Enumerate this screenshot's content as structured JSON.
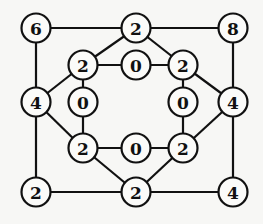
{
  "diagram": {
    "type": "graph",
    "nodes": [
      {
        "id": "n1",
        "label": "6",
        "x": 36,
        "y": 28
      },
      {
        "id": "n2",
        "label": "2",
        "x": 136,
        "y": 28
      },
      {
        "id": "n3",
        "label": "8",
        "x": 233,
        "y": 28
      },
      {
        "id": "n4",
        "label": "2",
        "x": 83,
        "y": 65
      },
      {
        "id": "n5",
        "label": "0",
        "x": 136,
        "y": 65
      },
      {
        "id": "n6",
        "label": "2",
        "x": 183,
        "y": 65
      },
      {
        "id": "n7",
        "label": "4",
        "x": 36,
        "y": 102
      },
      {
        "id": "n8",
        "label": "0",
        "x": 83,
        "y": 102
      },
      {
        "id": "n9",
        "label": "0",
        "x": 183,
        "y": 102
      },
      {
        "id": "n10",
        "label": "4",
        "x": 233,
        "y": 102
      },
      {
        "id": "n11",
        "label": "2",
        "x": 83,
        "y": 148
      },
      {
        "id": "n12",
        "label": "0",
        "x": 136,
        "y": 148
      },
      {
        "id": "n13",
        "label": "2",
        "x": 183,
        "y": 148
      },
      {
        "id": "n14",
        "label": "2",
        "x": 36,
        "y": 192
      },
      {
        "id": "n15",
        "label": "2",
        "x": 136,
        "y": 192
      },
      {
        "id": "n16",
        "label": "4",
        "x": 233,
        "y": 192
      }
    ],
    "edges": [
      [
        "n1",
        "n2"
      ],
      [
        "n2",
        "n3"
      ],
      [
        "n1",
        "n7"
      ],
      [
        "n3",
        "n10"
      ],
      [
        "n2",
        "n4"
      ],
      [
        "n2",
        "n6"
      ],
      [
        "n4",
        "n5"
      ],
      [
        "n5",
        "n6"
      ],
      [
        "n4",
        "n7"
      ],
      [
        "n6",
        "n10"
      ],
      [
        "n4",
        "n8"
      ],
      [
        "n6",
        "n9"
      ],
      [
        "n7",
        "n14"
      ],
      [
        "n10",
        "n16"
      ],
      [
        "n7",
        "n11"
      ],
      [
        "n10",
        "n13"
      ],
      [
        "n8",
        "n11"
      ],
      [
        "n9",
        "n13"
      ],
      [
        "n11",
        "n12"
      ],
      [
        "n12",
        "n13"
      ],
      [
        "n11",
        "n15"
      ],
      [
        "n13",
        "n15"
      ],
      [
        "n14",
        "n15"
      ],
      [
        "n15",
        "n16"
      ]
    ]
  }
}
